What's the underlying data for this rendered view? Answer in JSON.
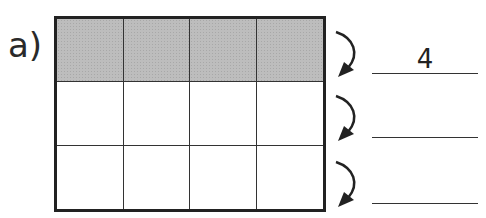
{
  "exercise": {
    "label": "a)",
    "grid": {
      "rows": 3,
      "columns": 4,
      "shaded_rows": [
        0
      ],
      "shade_color": "#bdbdbd",
      "line_color": "#222222"
    },
    "answers": [
      {
        "row": 1,
        "value": "4"
      },
      {
        "row": 2,
        "value": ""
      },
      {
        "row": 3,
        "value": ""
      }
    ]
  }
}
